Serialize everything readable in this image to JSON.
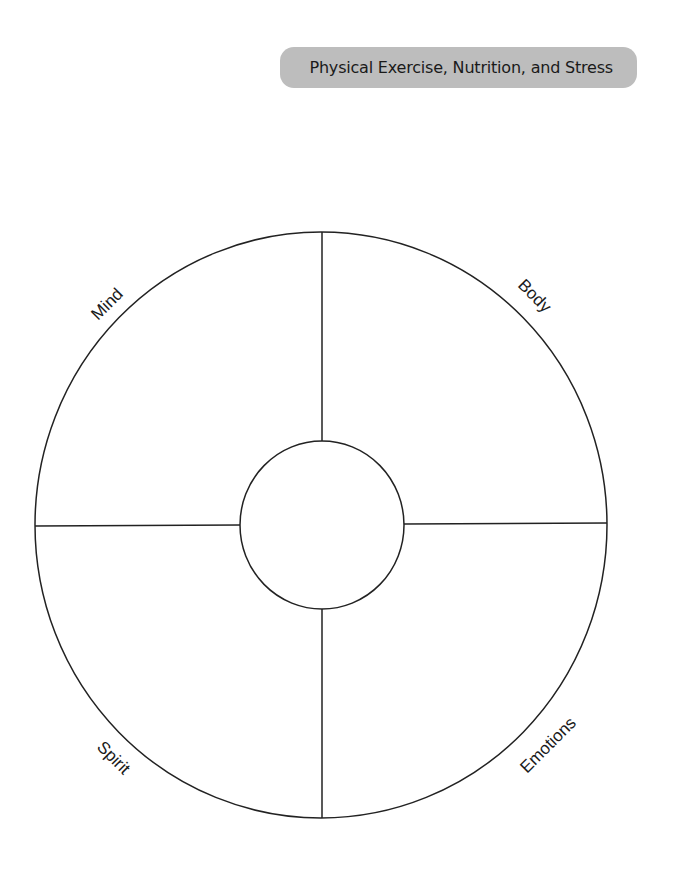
{
  "header": {
    "title": "Physical Exercise, Nutrition, and Stress",
    "background_color": "#bdbdbd"
  },
  "wheel": {
    "outer": {
      "cx": 321,
      "cy": 525,
      "rx": 286,
      "ry": 293
    },
    "inner": {
      "cx": 322,
      "cy": 525,
      "rx": 82,
      "ry": 84
    },
    "stroke_color": "#222222",
    "quadrants": [
      {
        "position": "top-left",
        "label": "Mind"
      },
      {
        "position": "top-right",
        "label": "Body"
      },
      {
        "position": "bottom-left",
        "label": "Spirit"
      },
      {
        "position": "bottom-right",
        "label": "Emotions"
      }
    ]
  }
}
